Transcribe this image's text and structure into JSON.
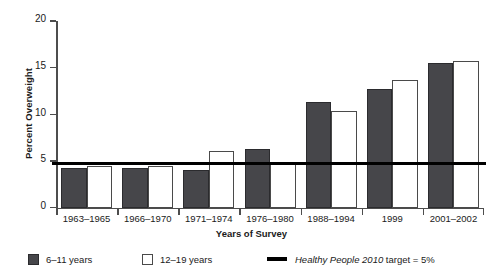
{
  "chart_data": {
    "type": "bar",
    "title": "",
    "xlabel": "Years of Survey",
    "ylabel": "Percent Overweight",
    "categories": [
      "1963–1965",
      "1966–1970",
      "1971–1974",
      "1976–1980",
      "1988–1994",
      "1999",
      "2001–2002"
    ],
    "series": [
      {
        "name": "6–11 years",
        "color": "#46464a",
        "style": "filled",
        "values": [
          4.2,
          4.2,
          4.0,
          6.3,
          11.3,
          12.7,
          15.5
        ]
      },
      {
        "name": "12–19 years",
        "color": "#ffffff",
        "style": "outlined",
        "values": [
          4.4,
          4.4,
          6.1,
          4.8,
          10.3,
          13.7,
          15.7
        ]
      }
    ],
    "annotations": [
      {
        "name": "healthy-people-2010-target",
        "label_italic": "Healthy People 2010",
        "label_rest": " target = 5%",
        "value": 4.6,
        "color": "#000000",
        "orientation": "horizontal"
      }
    ],
    "ylim": [
      0,
      20
    ],
    "yticks": [
      0,
      5,
      10,
      15,
      20
    ],
    "ytick_labels": [
      "0",
      "5",
      "10",
      "15",
      "20"
    ],
    "grid": false,
    "legend_position": "bottom"
  },
  "legend": {
    "items": [
      {
        "marker": "filled-square",
        "label": "6–11 years"
      },
      {
        "marker": "outlined-square",
        "label": "12–19 years"
      },
      {
        "marker": "line",
        "label_italic": "Healthy People 2010",
        "label_rest": " target = 5%"
      }
    ]
  }
}
